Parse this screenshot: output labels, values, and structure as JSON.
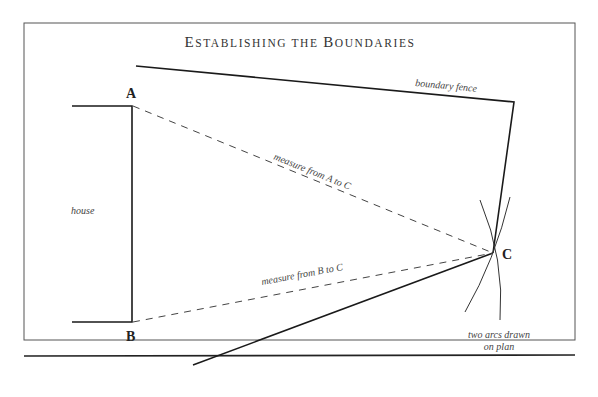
{
  "title": {
    "first_initial": "E",
    "first_rest": "STABLISHING THE ",
    "second_initial": "B",
    "second_rest": "OUNDARIES",
    "full": "Establishing the Boundaries"
  },
  "points": {
    "a": "A",
    "b": "B",
    "c": "C"
  },
  "labels": {
    "house": "house",
    "boundary_fence": "boundary fence",
    "measure_a_c": "measure from A to C",
    "measure_b_c": "measure from B to C",
    "arcs_line1": "two arcs drawn",
    "arcs_line2": "on plan"
  },
  "colors": {
    "line": "#1a1a1a",
    "frame": "#555555",
    "dashed": "#444444",
    "text": "#333333"
  }
}
